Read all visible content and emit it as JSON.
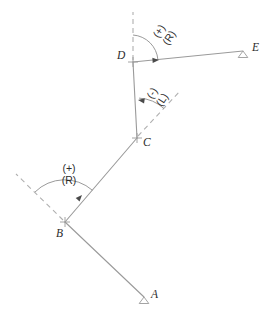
{
  "figure": {
    "width": 268,
    "height": 317,
    "background": "#ffffff",
    "line_color": "#9a9a9a",
    "dashed_color": "#b0b0b0",
    "arc_color": "#8f8f8f",
    "arrow_color": "#4a4a4a",
    "text_color": "#2b2b2b"
  },
  "stations": [
    {
      "id": "A",
      "label": "A",
      "x": 144,
      "y": 297,
      "marker": "triangle",
      "label_x": 151,
      "label_y": 294
    },
    {
      "id": "B",
      "label": "B",
      "x": 65,
      "y": 222,
      "marker": "tick",
      "label_x": 56,
      "label_y": 231
    },
    {
      "id": "C",
      "label": "C",
      "x": 137,
      "y": 138,
      "marker": "tick",
      "label_x": 143,
      "label_y": 140
    },
    {
      "id": "D",
      "label": "D",
      "x": 133,
      "y": 62,
      "marker": "tick",
      "label_x": 118,
      "label_y": 56
    },
    {
      "id": "E",
      "label": "E",
      "x": 243,
      "y": 51,
      "marker": "triangle",
      "label_x": 252,
      "label_y": 44
    }
  ],
  "segments": [
    {
      "name": "segment-AB",
      "from": "A",
      "to": "B"
    },
    {
      "name": "segment-BC",
      "from": "B",
      "to": "C"
    },
    {
      "name": "segment-CD",
      "from": "C",
      "to": "D"
    },
    {
      "name": "segment-DE",
      "from": "D",
      "to": "E"
    }
  ],
  "prolongations": [
    {
      "name": "prolongation-at-B",
      "at": "B",
      "x1": 65,
      "y1": 222,
      "x2": 16,
      "y2": 174
    },
    {
      "name": "prolongation-at-C",
      "at": "C",
      "x1": 137,
      "y1": 138,
      "x2": 181,
      "y2": 90
    },
    {
      "name": "prolongation-at-D",
      "at": "D",
      "x1": 133,
      "y1": 62,
      "x2": 133,
      "y2": 12
    }
  ],
  "angles": [
    {
      "id": "angle-B",
      "at": "B",
      "sign": "(+)",
      "hand": "(R)",
      "label_x": 67,
      "label_y": 170,
      "rotated": false,
      "arc": {
        "cx": 65,
        "cy": 222,
        "r": 42,
        "start_deg": 224.4,
        "end_deg": 310.6
      },
      "arrow": {
        "x": 80,
        "y": 197,
        "rot": 312
      }
    },
    {
      "id": "angle-C",
      "at": "C",
      "sign": "(-)",
      "hand": "(L)",
      "label_x": 157,
      "label_y": 94,
      "rotated": true,
      "arc": {
        "cx": 137,
        "cy": 138,
        "r": 40,
        "start_deg": 312.5,
        "end_deg": 267.0
      },
      "arrow": {
        "x": 139,
        "y": 100,
        "rot": 188
      }
    },
    {
      "id": "angle-D",
      "at": "D",
      "sign": "(+)",
      "hand": "(R)",
      "label_x": 163,
      "label_y": 32,
      "rotated": true,
      "arc": {
        "cx": 133,
        "cy": 62,
        "r": 27,
        "start_deg": 270.0,
        "end_deg": 354.5
      },
      "arrow": {
        "x": 159,
        "y": 59,
        "rot": 356
      }
    }
  ]
}
